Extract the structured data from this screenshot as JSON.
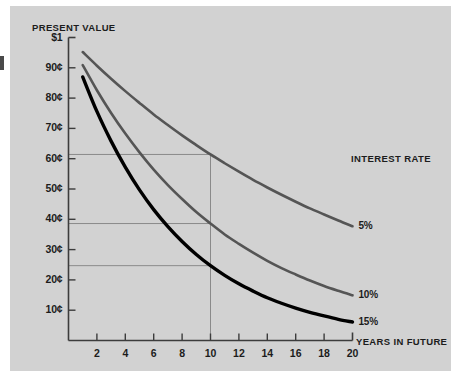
{
  "figure": {
    "background_color": "#ffffff",
    "panel_color": "#d2d2d2",
    "axis_color": "#3c3c3c"
  },
  "chart_data": {
    "type": "line",
    "title": "Present value",
    "xlabel": "Years in future",
    "ylabel": "Present value",
    "y_top_label": "$1",
    "xlim": [
      0,
      20
    ],
    "ylim": [
      0,
      100
    ],
    "grid": false,
    "legend_position": "right",
    "legend_title": "Interest rate",
    "x_ticks": [
      2,
      4,
      6,
      8,
      10,
      12,
      14,
      16,
      18,
      20
    ],
    "x_tick_labels": [
      "2",
      "4",
      "6",
      "8",
      "10",
      "12",
      "14",
      "16",
      "18",
      "20"
    ],
    "y_ticks": [
      100,
      90,
      80,
      70,
      60,
      50,
      40,
      30,
      20,
      10
    ],
    "y_tick_labels": [
      "$1",
      "90¢",
      "80¢",
      "70¢",
      "60¢",
      "50¢",
      "40¢",
      "30¢",
      "20¢",
      "10¢"
    ],
    "x": [
      1,
      2,
      3,
      4,
      5,
      6,
      7,
      8,
      9,
      10,
      11,
      12,
      13,
      14,
      15,
      16,
      17,
      18,
      19,
      20
    ],
    "series": [
      {
        "name": "5%",
        "color": "#555555",
        "width": 2.6,
        "label": "5%",
        "values": [
          95.2,
          90.7,
          86.4,
          82.3,
          78.4,
          74.6,
          71.1,
          67.7,
          64.5,
          61.4,
          58.5,
          55.7,
          53.0,
          50.5,
          48.1,
          45.8,
          43.6,
          41.6,
          39.6,
          37.7
        ]
      },
      {
        "name": "10%",
        "color": "#555555",
        "width": 2.6,
        "label": "10%",
        "values": [
          90.9,
          82.6,
          75.1,
          68.3,
          62.1,
          56.4,
          51.3,
          46.7,
          42.4,
          38.6,
          35.0,
          31.9,
          29.0,
          26.3,
          23.9,
          21.8,
          19.8,
          18.0,
          16.4,
          14.9
        ]
      },
      {
        "name": "15%",
        "color": "#000000",
        "width": 3.4,
        "label": "15%",
        "values": [
          87.0,
          75.6,
          65.8,
          57.2,
          49.7,
          43.2,
          37.6,
          32.7,
          28.4,
          24.7,
          21.5,
          18.7,
          16.3,
          14.1,
          12.3,
          10.7,
          9.3,
          8.1,
          7.0,
          6.1
        ]
      }
    ],
    "annotations": [
      {
        "type": "vline",
        "x": 10,
        "y_top": 61.4,
        "note": "year-10 reference"
      },
      {
        "type": "hline",
        "y": 61.4,
        "x_end": 10,
        "note": "5% at year 10"
      },
      {
        "type": "hline",
        "y": 38.6,
        "x_end": 10,
        "note": "10% at year 10"
      },
      {
        "type": "hline",
        "y": 24.7,
        "x_end": 10,
        "note": "15% at year 10"
      }
    ]
  }
}
